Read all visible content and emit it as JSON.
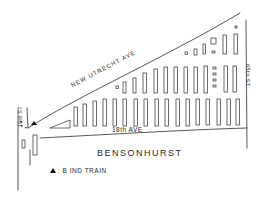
{
  "map": {
    "title": "Bensonhurst",
    "style": "hand-drawn sketch map",
    "colors": {
      "ink": "#2a2a2a",
      "background": "#ffffff"
    },
    "streets": {
      "diagonal": "NEW UTRECHT AVE",
      "horizontal": "18th AVE",
      "right_vertical": "65th ST",
      "left_vertical": "15th ST"
    },
    "area_label": "BENSONHURST",
    "legend": {
      "symbol": "triangle",
      "text": ": B IND TRAIN"
    },
    "markers": [
      {
        "type": "train-station",
        "symbol": "triangle",
        "x": 35,
        "y": 128
      }
    ]
  }
}
